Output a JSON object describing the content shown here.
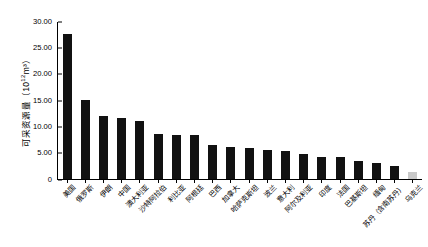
{
  "chart_data": {
    "type": "bar",
    "title": "",
    "xlabel": "",
    "ylabel": "可采资源量（10¹²m³）",
    "ylabel_text": "可采资源量（10",
    "ylabel_exp": "12",
    "ylabel_tail": "m³）",
    "ylim": [
      0,
      30
    ],
    "grid": false,
    "legend": "none",
    "ytick_labels": [
      "0",
      "5.00",
      "10.00",
      "15.00",
      "20.00",
      "25.00",
      "30.00"
    ],
    "ytick_values": [
      0,
      5,
      10,
      15,
      20,
      25,
      30
    ],
    "categories": [
      "美国",
      "俄罗斯",
      "伊朗",
      "中国",
      "澳大利亚",
      "沙特阿拉伯",
      "利比亚",
      "阿根廷",
      "巴西",
      "加拿大",
      "哈萨克斯坦",
      "波兰",
      "意大利",
      "阿尔及利亚",
      "印度",
      "法国",
      "巴基斯坦",
      "缅甸",
      "苏丹（含南苏丹）",
      "乌克兰"
    ],
    "values": [
      27.5,
      15.0,
      11.9,
      11.5,
      11.0,
      8.5,
      8.4,
      8.3,
      6.4,
      6.1,
      5.9,
      5.5,
      5.3,
      4.8,
      4.2,
      4.2,
      3.4,
      3.0,
      2.4,
      1.3
    ],
    "bar_colors": [
      "#111111",
      "#111111",
      "#111111",
      "#111111",
      "#111111",
      "#111111",
      "#111111",
      "#111111",
      "#111111",
      "#111111",
      "#111111",
      "#111111",
      "#111111",
      "#111111",
      "#111111",
      "#111111",
      "#111111",
      "#111111",
      "#111111",
      "#c9c9c9"
    ],
    "highlight_index": 19,
    "highlight_color": "#c9c9c9",
    "series_color": "#111111"
  }
}
